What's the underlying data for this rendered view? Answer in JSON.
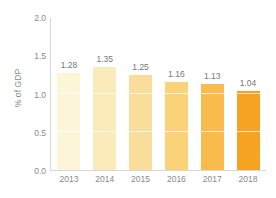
{
  "chart_data": {
    "type": "bar",
    "title": "",
    "subtitle": "",
    "xlabel": "",
    "ylabel": "% of GDP",
    "categories": [
      "2013",
      "2014",
      "2015",
      "2016",
      "2017",
      "2018"
    ],
    "values": [
      1.28,
      1.35,
      1.25,
      1.16,
      1.13,
      1.04
    ],
    "value_labels": [
      "1.28",
      "1.35",
      "1.25",
      "1.16",
      "1.13",
      "1.04"
    ],
    "ylim": [
      0.0,
      2.0
    ],
    "ytick_labels": [
      "0.0",
      "0.5",
      "1.0",
      "1.5",
      "2.0"
    ],
    "ytick_values": [
      0.0,
      0.5,
      1.0,
      1.5,
      2.0
    ],
    "grid": true,
    "gridline_values": [
      0.5,
      1.0,
      1.5
    ],
    "legend": false,
    "legend_position": "none",
    "bar_colors": [
      "#FDF5D8",
      "#FBEBBB",
      "#F9DD9A",
      "#FAD278",
      "#FABB4D",
      "#F7A322"
    ],
    "axis_color": "#D8D8D8",
    "label_color": "#8A8A8A",
    "value_label_color": "#77777A",
    "gridline_color": "#FFFFFF",
    "background_color": "#FFFFFF"
  }
}
